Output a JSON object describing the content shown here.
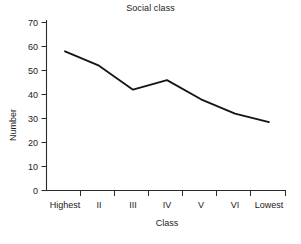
{
  "chart_data": {
    "type": "line",
    "title": "Social class",
    "xlabel": "Class",
    "ylabel": "Number",
    "categories": [
      "Highest",
      "II",
      "III",
      "IV",
      "V",
      "VI",
      "Lowest"
    ],
    "values": [
      58,
      52,
      42,
      46,
      38,
      32,
      28.5
    ],
    "series": [
      {
        "name": "Number",
        "values": [
          58,
          52,
          42,
          46,
          38,
          32,
          28.5
        ]
      }
    ],
    "ylim": [
      0,
      70
    ],
    "y_ticks": [
      0,
      10,
      20,
      30,
      40,
      50,
      60,
      70
    ],
    "y_tick_labels": [
      "0",
      "10",
      "20",
      "30",
      "40",
      "50",
      "60",
      "70"
    ],
    "grid": false,
    "legend": false,
    "legend_position": "none",
    "line_color": "#141414",
    "axis_color": "#2b2b2b",
    "background_color": "#ffffff"
  }
}
